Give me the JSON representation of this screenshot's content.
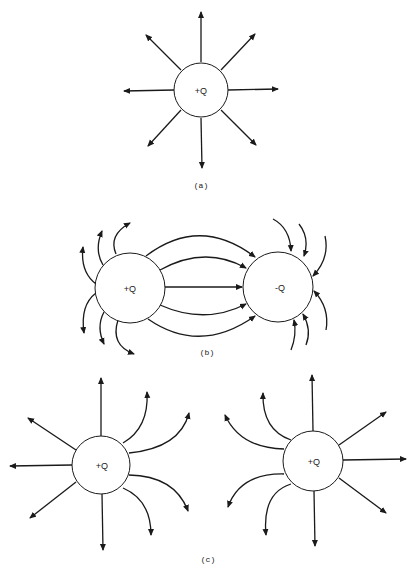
{
  "figure": {
    "panels": [
      {
        "id": "a",
        "caption": "(a)",
        "description": "Isolated positive charge with radial field lines",
        "charges": [
          {
            "label": "+Q"
          }
        ]
      },
      {
        "id": "b",
        "caption": "(b)",
        "description": "Field lines between positive and negative charge",
        "charges": [
          {
            "label": "+Q"
          },
          {
            "label": "-Q"
          }
        ]
      },
      {
        "id": "c",
        "caption": "(c)",
        "description": "Field lines of two like positive charges repelling",
        "charges": [
          {
            "label": "+Q"
          },
          {
            "label": "+Q"
          }
        ]
      }
    ]
  },
  "colors": {
    "line": "#1a1a1a",
    "background": "#ffffff"
  }
}
